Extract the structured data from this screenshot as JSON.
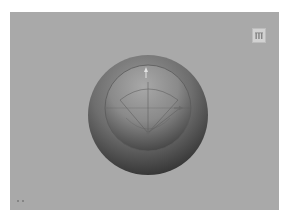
{
  "window": {
    "caption_top": "",
    "caption_bottom": ""
  },
  "viewport": {
    "background": "#a9a9a9",
    "scene": {
      "outer_sphere": {
        "cx": 138,
        "cy": 103,
        "r": 60,
        "color_light": "#8a8a8a",
        "color_dark": "#3a3a3a"
      },
      "inner_sphere": {
        "cx": 138,
        "cy": 96,
        "r": 43,
        "color_light": "#9a9a9a",
        "color_dark": "#4a4a4a"
      },
      "pivot": {
        "x": 138,
        "y": 121
      }
    },
    "corner_button": {
      "icon": "bars-thumbnail-icon",
      "tooltip": ""
    },
    "axis_indicator": {
      "icon": "axis-gizmo-icon"
    }
  }
}
